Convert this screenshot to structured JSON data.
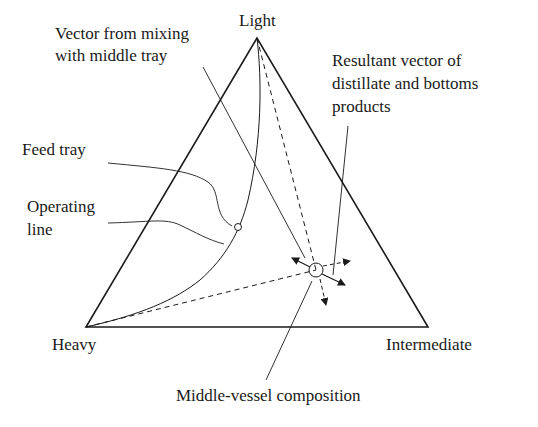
{
  "diagram": {
    "type": "ternary-composition-diagram",
    "vertices": {
      "top": "Light",
      "bottom_left": "Heavy",
      "bottom_right": "Intermediate"
    },
    "annotations": {
      "vector_mixing_line1": "Vector from mixing",
      "vector_mixing_line2": "with middle tray",
      "resultant_line1": "Resultant vector of",
      "resultant_line2": "distillate and bottoms",
      "resultant_line3": "products",
      "feed_tray": "Feed tray",
      "operating_line1": "Operating",
      "operating_line2": "line",
      "middle_vessel": "Middle-vessel composition"
    },
    "colors": {
      "line": "#1a1a1a",
      "background": "#ffffff"
    }
  }
}
